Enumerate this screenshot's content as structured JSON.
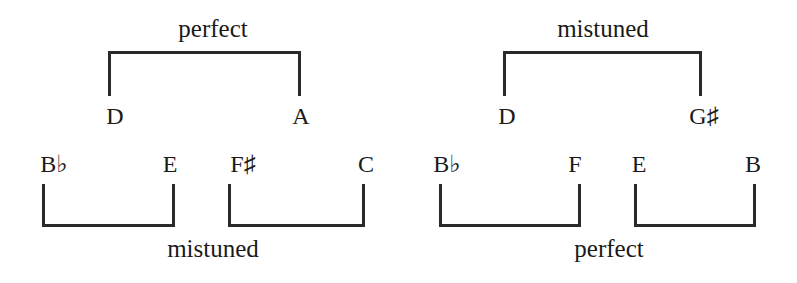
{
  "diagrams": [
    {
      "top_label": "perfect",
      "top_pair": [
        "D",
        "A"
      ],
      "bottom_pairs": [
        [
          "B♭",
          "E"
        ],
        [
          "F♯",
          "C"
        ]
      ],
      "bottom_label": "mistuned"
    },
    {
      "top_label": "mistuned",
      "top_pair": [
        "D",
        "G♯"
      ],
      "bottom_pairs": [
        [
          "B♭",
          "F"
        ],
        [
          "E",
          "B"
        ]
      ],
      "bottom_label": "perfect"
    }
  ],
  "colors": {
    "ink": "#1a1a1a",
    "background": "#ffffff"
  }
}
